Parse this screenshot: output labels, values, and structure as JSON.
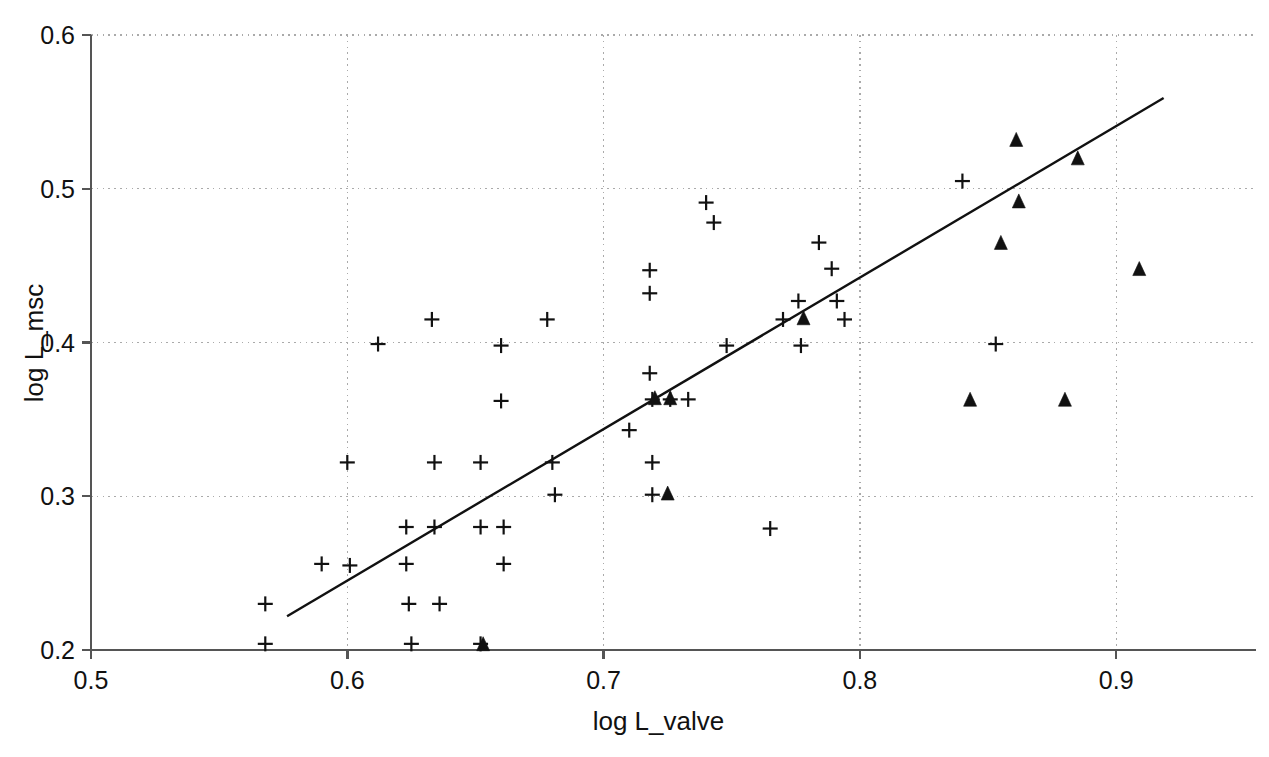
{
  "chart_data": {
    "type": "scatter",
    "title": "",
    "xlabel": "log L_valve",
    "ylabel": "log L_msc",
    "xlim": [
      0.5,
      0.9545
    ],
    "ylim": [
      0.2,
      0.6
    ],
    "xticks": [
      0.5,
      0.6,
      0.7,
      0.8,
      0.9
    ],
    "yticks": [
      0.2,
      0.3,
      0.4,
      0.5,
      0.6
    ],
    "xtick_labels": [
      "0.5",
      "0.6",
      "0.7",
      "0.8",
      "0.9"
    ],
    "ytick_labels": [
      "0.2",
      "0.3",
      "0.4",
      "0.5",
      "0.6"
    ],
    "grid": true,
    "grid_style": "dotted",
    "legend": "none",
    "marker_color": "#111111",
    "line_color": "#111111",
    "axis_color": "#555555",
    "grid_color": "#aaaaaa",
    "series": [
      {
        "name": "plus",
        "marker": "plus",
        "points": [
          [
            0.568,
            0.23
          ],
          [
            0.568,
            0.204
          ],
          [
            0.59,
            0.256
          ],
          [
            0.6,
            0.322
          ],
          [
            0.601,
            0.255
          ],
          [
            0.612,
            0.399
          ],
          [
            0.623,
            0.28
          ],
          [
            0.623,
            0.256
          ],
          [
            0.624,
            0.23
          ],
          [
            0.625,
            0.204
          ],
          [
            0.633,
            0.415
          ],
          [
            0.634,
            0.322
          ],
          [
            0.634,
            0.28
          ],
          [
            0.636,
            0.23
          ],
          [
            0.652,
            0.322
          ],
          [
            0.652,
            0.28
          ],
          [
            0.652,
            0.204
          ],
          [
            0.66,
            0.398
          ],
          [
            0.66,
            0.362
          ],
          [
            0.661,
            0.28
          ],
          [
            0.661,
            0.256
          ],
          [
            0.678,
            0.415
          ],
          [
            0.68,
            0.322
          ],
          [
            0.681,
            0.301
          ],
          [
            0.71,
            0.343
          ],
          [
            0.718,
            0.447
          ],
          [
            0.718,
            0.432
          ],
          [
            0.718,
            0.38
          ],
          [
            0.719,
            0.363
          ],
          [
            0.719,
            0.322
          ],
          [
            0.719,
            0.301
          ],
          [
            0.726,
            0.363
          ],
          [
            0.733,
            0.363
          ],
          [
            0.74,
            0.491
          ],
          [
            0.743,
            0.478
          ],
          [
            0.748,
            0.398
          ],
          [
            0.765,
            0.279
          ],
          [
            0.77,
            0.415
          ],
          [
            0.776,
            0.427
          ],
          [
            0.777,
            0.398
          ],
          [
            0.784,
            0.465
          ],
          [
            0.789,
            0.448
          ],
          [
            0.791,
            0.427
          ],
          [
            0.794,
            0.415
          ],
          [
            0.84,
            0.505
          ],
          [
            0.853,
            0.399
          ]
        ]
      },
      {
        "name": "triangle",
        "marker": "triangle",
        "points": [
          [
            0.653,
            0.203
          ],
          [
            0.72,
            0.363
          ],
          [
            0.726,
            0.363
          ],
          [
            0.725,
            0.301
          ],
          [
            0.778,
            0.415
          ],
          [
            0.843,
            0.362
          ],
          [
            0.855,
            0.464
          ],
          [
            0.861,
            0.531
          ],
          [
            0.862,
            0.491
          ],
          [
            0.88,
            0.362
          ],
          [
            0.885,
            0.519
          ],
          [
            0.909,
            0.447
          ]
        ]
      }
    ],
    "trend_line": {
      "name": "regression-line",
      "x_start": 0.5765,
      "y_start": 0.222,
      "x_end": 0.9185,
      "y_end": 0.559
    }
  }
}
